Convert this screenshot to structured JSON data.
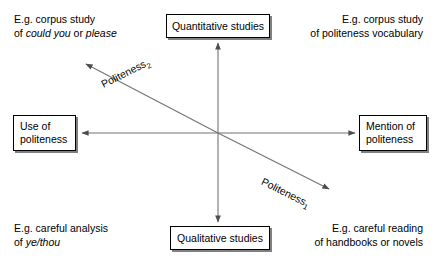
{
  "figure": {
    "background_color": "#ffffff",
    "line_color": "#595959",
    "box_border_color": "#000000",
    "box_shadow_color": "#808080"
  },
  "axes": {
    "vertical": {
      "top_pole": "Quantitative studies",
      "bottom_pole": "Qualitative studies"
    },
    "horizontal": {
      "left_pole_line1": "Use of",
      "left_pole_line2": "politeness",
      "right_pole_line1": "Mention of",
      "right_pole_line2": "politeness"
    },
    "diagonal_up_left": {
      "label_text": "Politeness",
      "label_subscript": "2"
    },
    "diagonal_down_right": {
      "label_text": "Politeness",
      "label_subscript": "1"
    }
  },
  "captions": {
    "top_left": {
      "line1": "E.g. corpus study",
      "line2_prefix": "of ",
      "line2_italic1": "could you",
      "line2_middle": " or ",
      "line2_italic2": "please"
    },
    "top_right": {
      "line1": "E.g. corpus study",
      "line2": "of politeness vocabulary"
    },
    "bottom_left": {
      "line1": "E.g. careful analysis",
      "line2_prefix": "of ",
      "line2_italic1": "ye/thou"
    },
    "bottom_right": {
      "line1": "E.g. careful reading",
      "line2": "of handbooks or novels"
    }
  }
}
